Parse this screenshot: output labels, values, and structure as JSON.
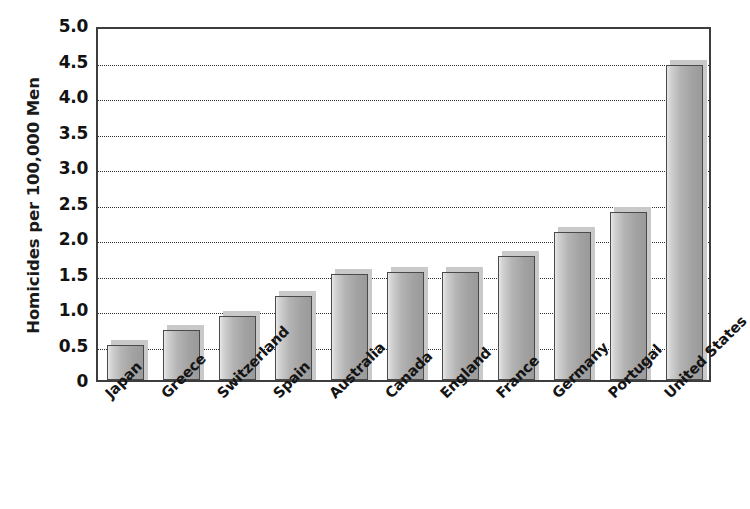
{
  "chart_data": {
    "type": "bar",
    "title": "",
    "subtitle": "",
    "xlabel": "",
    "ylabel": "Homicides per 100,000 Men",
    "categories": [
      "Japan",
      "Greece",
      "Switzerland",
      "Spain",
      "Australia",
      "Canada",
      "England",
      "France",
      "Germany",
      "Portugal",
      "United States"
    ],
    "values": [
      0.5,
      0.7,
      0.9,
      1.18,
      1.5,
      1.52,
      1.52,
      1.75,
      2.08,
      2.37,
      4.43
    ],
    "series": [
      {
        "name": "Homicides per 100,000 Men",
        "values": [
          0.5,
          0.7,
          0.9,
          1.18,
          1.5,
          1.52,
          1.52,
          1.75,
          2.08,
          2.37,
          4.43
        ]
      }
    ],
    "ylim": [
      0,
      5.0
    ],
    "ytick_values": [
      0,
      0.5,
      1.0,
      1.5,
      2.0,
      2.5,
      3.0,
      3.5,
      4.0,
      4.5,
      5.0
    ],
    "ytick_labels": [
      "0",
      "0.5",
      "1.0",
      "1.5",
      "2.0",
      "2.5",
      "3.0",
      "3.5",
      "4.0",
      "4.5",
      "5.0"
    ],
    "grid": true,
    "grid_axis": "y",
    "grid_style": "dotted",
    "legend": false,
    "legend_position": "none",
    "bar_color": "#ababab",
    "bar_edge_color": "#4a4a4a",
    "background_color": "#ffffff",
    "axis_color": "#3d3d3d",
    "text_color": "#141414",
    "xtick_rotation": -45
  }
}
